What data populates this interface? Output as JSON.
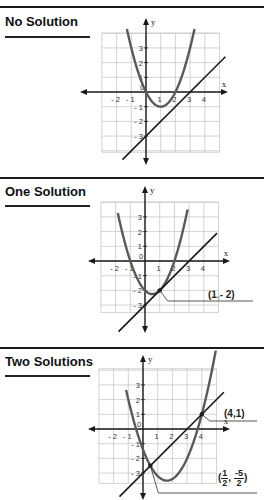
{
  "page": {
    "top_rule_y": 7
  },
  "sections": [
    {
      "title": "No Solution",
      "title_y": 14,
      "underline_y": 36,
      "divider_y": 177,
      "graph": {
        "origin": [
          146,
          92
        ],
        "cell": 14.7,
        "grid_x": [
          -3,
          5
        ],
        "grid_y": [
          -4.1,
          4
        ],
        "x_axis_extent": [
          80,
          228
        ],
        "y_axis_extent": [
          18,
          165
        ],
        "x_label": "x",
        "y_label": "y",
        "x_ticks": [
          "-2",
          "-1",
          "0",
          "1",
          "2",
          "3",
          "4"
        ],
        "y_ticks": [
          "3",
          "2",
          "1",
          "-1",
          "-2",
          "-3"
        ],
        "parabola": {
          "a": 1,
          "b": -2,
          "c": 0,
          "x_range": [
            -1.3,
            3.3
          ]
        },
        "line": {
          "m": 1,
          "k": -3,
          "x_range": [
            -1.6,
            5.4
          ]
        },
        "points": []
      }
    },
    {
      "title": "One Solution",
      "title_y": 184,
      "underline_y": 205,
      "divider_y": 347,
      "graph": {
        "origin": [
          145,
          261
        ],
        "cell": 14.7,
        "grid_x": [
          -3,
          5
        ],
        "grid_y": [
          -3.5,
          4
        ],
        "x_axis_extent": [
          88,
          230
        ],
        "y_axis_extent": [
          186,
          333
        ],
        "x_label": "x",
        "y_label": "y",
        "x_ticks": [
          "-2",
          "-1",
          "0",
          "1",
          "2",
          "3",
          "4"
        ],
        "y_ticks": [
          "3",
          "2",
          "1",
          "-1",
          "-2",
          "-3"
        ],
        "parabola": {
          "a": 1,
          "b": -1,
          "c": -2,
          "x_range": [
            -1.85,
            2.9
          ]
        },
        "line": {
          "m": 1,
          "k": -3,
          "x_range": [
            -1.8,
            4.9
          ]
        },
        "points": [
          {
            "x": 1,
            "y": -2,
            "label": "(1,- 2)",
            "leader_to": [
              253,
              301
            ],
            "label_pos": [
              208,
              289
            ]
          }
        ]
      }
    },
    {
      "title": "Two Solutions",
      "title_y": 354,
      "underline_y": 375,
      "divider_y": null,
      "graph": {
        "origin": [
          143,
          429
        ],
        "cell": 14.7,
        "grid_x": [
          -3,
          5
        ],
        "grid_y": [
          -3.7,
          4.1
        ],
        "x_axis_extent": [
          88,
          230
        ],
        "y_axis_extent": [
          355,
          500
        ],
        "x_label": "x",
        "y_label": "y",
        "x_ticks": [
          "-2",
          "-1",
          "0",
          "1",
          "2",
          "3",
          "4"
        ],
        "y_ticks": [
          "3",
          "2",
          "1",
          "-1",
          "-2",
          "-3"
        ],
        "parabola": {
          "a": 0.8,
          "b": -2.6,
          "c": -1.4,
          "x_range": [
            -1.15,
            4.95
          ]
        },
        "line": {
          "m": 1,
          "k": -3,
          "x_range": [
            -1.6,
            5.5
          ]
        },
        "points": [
          {
            "x": 4,
            "y": 1,
            "label": "(4,1)",
            "leader_to": [
              257,
              421
            ],
            "label_pos": [
              224,
              408
            ]
          },
          {
            "x": 0.5,
            "y": -2.5,
            "label_frac": {
              "open": "(",
              "n1": "1",
              "d1": "2",
              "sep": ",",
              "n2": "-5",
              "d2": "2",
              "close": ")"
            },
            "leader_to": [
              257,
              493
            ],
            "label_pos": [
              218,
              469
            ]
          }
        ]
      }
    }
  ],
  "colors": {
    "ink": "#1a1a1a",
    "curve": "#5a5a5a",
    "grid": "#c8c8c8",
    "rule": "#1a1a1a"
  }
}
